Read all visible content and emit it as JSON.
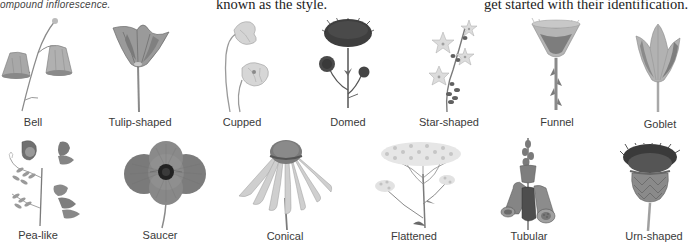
{
  "captions": [
    {
      "text": "ompound inflorescence.",
      "style": "sans-italic"
    },
    {
      "text": "known as the style.",
      "style": "serif"
    },
    {
      "text": "get started with their identification.",
      "style": "serif"
    }
  ],
  "flower_shapes": {
    "row1": [
      {
        "label": "Bell",
        "icon": "bell-flower-illustration"
      },
      {
        "label": "Tulip-shaped",
        "icon": "tulip-flower-illustration"
      },
      {
        "label": "Cupped",
        "icon": "cupped-flower-illustration"
      },
      {
        "label": "Domed",
        "icon": "domed-flower-illustration"
      },
      {
        "label": "Star-shaped",
        "icon": "star-flower-illustration"
      },
      {
        "label": "Funnel",
        "icon": "funnel-flower-illustration"
      },
      {
        "label": "Goblet",
        "icon": "goblet-flower-illustration"
      }
    ],
    "row2": [
      {
        "label": "Pea-like",
        "icon": "pea-flower-illustration"
      },
      {
        "label": "Saucer",
        "icon": "saucer-flower-illustration"
      },
      {
        "label": "Conical",
        "icon": "conical-flower-illustration"
      },
      {
        "label": "Flattened",
        "icon": "flattened-flower-illustration"
      },
      {
        "label": "Tubular",
        "icon": "tubular-flower-illustration"
      },
      {
        "label": "Urn-shaped",
        "icon": "urn-flower-illustration"
      }
    ]
  }
}
